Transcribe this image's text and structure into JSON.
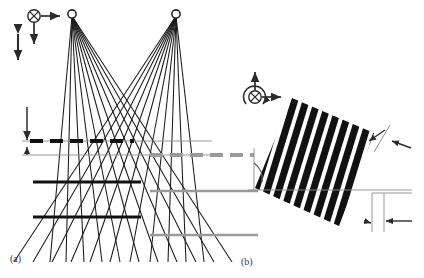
{
  "figure": {
    "caption_a": "(a)",
    "caption_b": "(b)",
    "background_color": "#ffffff",
    "ink_black": "#111111",
    "ink_gray": "#9a9a9a",
    "label_color": "#3a3a3a"
  },
  "panel_a": {
    "name": "two-source interference ray diagram",
    "axis_indicator": {
      "into_page_icon": "circle-cross",
      "arrow_right": "x-axis",
      "arrow_down": "z-axis",
      "double_arrow_vertical": "displacement"
    },
    "sources": [
      {
        "id": "source-left",
        "x": 72,
        "y": 14
      },
      {
        "id": "source-right",
        "x": 176,
        "y": 14
      }
    ],
    "ray_count_per_source": 11,
    "fringe_planes": [
      {
        "id": "plane-dashed-upper",
        "y": 141,
        "style": "dashed",
        "color": "#111111",
        "x_start": 28,
        "x_end": 132
      },
      {
        "id": "plane-dashed-lower",
        "y": 155,
        "style": "dashed",
        "color": "#9a9a9a",
        "x_start": 150,
        "x_end": 254
      },
      {
        "id": "plane-solid-upper",
        "y": 182,
        "style": "solid",
        "color": "#111111",
        "x_start": 33,
        "x_end": 140
      },
      {
        "id": "plane-solid-upper-gray",
        "y": 191,
        "style": "solid",
        "color": "#9a9a9a",
        "x_start": 152,
        "x_end": 256
      },
      {
        "id": "plane-solid-lower",
        "y": 217,
        "style": "solid",
        "color": "#111111",
        "x_start": 33,
        "x_end": 140
      },
      {
        "id": "plane-solid-lower-gray",
        "y": 235,
        "style": "solid",
        "color": "#9a9a9a",
        "x_start": 152,
        "x_end": 256
      }
    ],
    "reference_lines": [
      {
        "id": "reference-line-upper",
        "y": 141
      },
      {
        "id": "reference-line-lower",
        "y": 155
      }
    ],
    "dimension_arrow_down": {
      "x": 27,
      "y_start": 108,
      "y_end": 141
    },
    "dimension_arrow_small": {
      "x": 27,
      "y_start": 155,
      "y_end": 148
    }
  },
  "panel_b": {
    "name": "tilted grating pattern",
    "axis_indicator": {
      "into_page_icon": "circle-cross",
      "arrow_up": "y-axis",
      "arrow_right": "x-axis",
      "rotation_arrow": "tilt-rotation"
    },
    "grating": {
      "stripe_count": 16,
      "tilt_degrees": 17,
      "stripe_color": "#111111",
      "gap_color": "#ffffff"
    },
    "angle_arc": {
      "id": "tilt-angle-arc",
      "vertex_x": 254,
      "vertex_y": 190
    },
    "dimension_period": {
      "id": "period-dimension",
      "label": "grating period"
    },
    "dimension_horizontal": {
      "id": "horizontal-pitch-dimension",
      "label": "projected pitch"
    },
    "baseline": {
      "id": "horizontal-baseline",
      "y": 190,
      "x_start": 248,
      "x_end": 412
    },
    "vertical_reference": {
      "id": "vertical-reference",
      "x": 254,
      "y_start": 148,
      "y_end": 190
    }
  }
}
